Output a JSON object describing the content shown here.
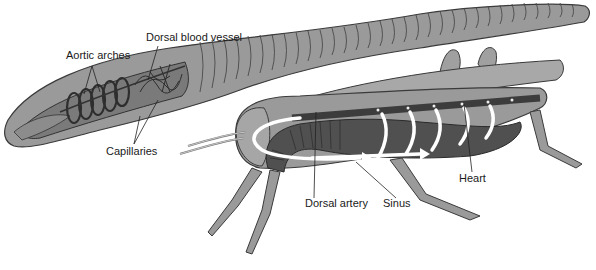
{
  "diagram": {
    "subjects": [
      "earthworm",
      "grasshopper"
    ],
    "labels": {
      "aortic_arches": "Aortic arches",
      "dorsal_blood_vessel": "Dorsal blood vessel",
      "capillaries": "Capillaries",
      "dorsal_artery": "Dorsal artery",
      "sinus": "Sinus",
      "heart": "Heart"
    },
    "colors": {
      "body_fill": "#9a9a9a",
      "body_light": "#b8b8b8",
      "outline": "#3a3a3a",
      "vessel_dark": "#3c3c3c",
      "flow_arrow": "#ffffff",
      "background": "#ffffff"
    }
  }
}
